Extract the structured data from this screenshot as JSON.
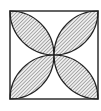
{
  "diagram": {
    "type": "geometry-figure",
    "square": {
      "x": 10,
      "y": 11,
      "size": 88
    },
    "petals": [
      "top-left",
      "top-right",
      "bottom-left",
      "bottom-right"
    ],
    "colors": {
      "stroke": "#222222",
      "hatch": "#555555",
      "fill": "#e8e8e8",
      "background": "#ffffff"
    },
    "hatch_direction": "diagonal"
  }
}
